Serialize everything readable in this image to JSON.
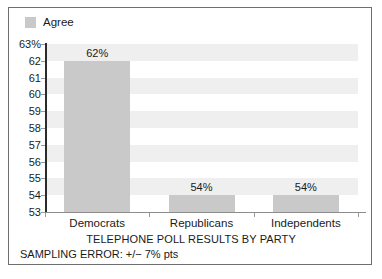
{
  "legend": {
    "items": [
      {
        "label": "Agree",
        "color": "#c9c9c9"
      }
    ]
  },
  "chart_data": {
    "type": "bar",
    "title": "TELEPHONE POLL RESULTS BY PARTY",
    "subtitle": "SAMPLING ERROR: +/− 7% pts",
    "categories": [
      "Democrats",
      "Republicans",
      "Independents"
    ],
    "values": [
      62,
      54,
      54
    ],
    "value_labels": [
      "62%",
      "54%",
      "54%"
    ],
    "series": [
      {
        "name": "Agree",
        "values": [
          62,
          54,
          54
        ],
        "color": "#c9c9c9"
      }
    ],
    "xlabel": "",
    "ylabel": "",
    "ylim": [
      53,
      63
    ],
    "ytick_labels": [
      "63%",
      "62",
      "61",
      "60",
      "59",
      "58",
      "57",
      "56",
      "55",
      "54",
      "53"
    ],
    "ytick_values": [
      63,
      62,
      61,
      60,
      59,
      58,
      57,
      56,
      55,
      54,
      53
    ],
    "grid": "horizontal-alternating-bands",
    "band_color": "#efefef",
    "legend_position": "top-left",
    "axis_color": "#2b2b2b",
    "background": "#ffffff"
  }
}
